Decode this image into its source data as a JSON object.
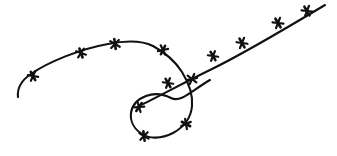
{
  "figure": {
    "background_color": "#ffffff",
    "ink_color": "#111111",
    "canvas": {
      "width": 337,
      "height": 156
    }
  },
  "artwork": {
    "stroke_width": 2.1,
    "wire_segments": [
      {
        "name": "left-sweep-and-hump",
        "path": "M 18 97 C 17 88 22 80 31 74 C 48 62 80 49 108 44 C 128 40 143 41 153 46 C 166 53 175 61 182 72 C 190 85 193 96 192 106 C 191 118 184 127 173 133 C 161 139 149 139 142 134 C 134 129 130 121 131 113 C 132 105 138 99 146 96 C 154 93 163 94 171 98 C 181 103 191 91 210 80"
      },
      {
        "name": "ascending-right-line",
        "path": "M 139 106 C 160 96 185 82 210 70 C 245 53 290 26 325 5"
      }
    ],
    "barbs": [
      {
        "id": "barb-01",
        "x": 33,
        "y": 76,
        "angle": -28,
        "size": 9.5
      },
      {
        "id": "barb-02",
        "x": 81,
        "y": 53,
        "angle": -19,
        "size": 9.5
      },
      {
        "id": "barb-03",
        "x": 115,
        "y": 44,
        "angle": -8,
        "size": 10.0
      },
      {
        "id": "barb-04",
        "x": 163,
        "y": 50,
        "angle": 26,
        "size": 9.5
      },
      {
        "id": "barb-05",
        "x": 192,
        "y": 79,
        "angle": 76,
        "size": 10.0
      },
      {
        "id": "barb-06",
        "x": 186,
        "y": 124,
        "angle": 118,
        "size": 9.5
      },
      {
        "id": "barb-07",
        "x": 144,
        "y": 136,
        "angle": 172,
        "size": 9.5
      },
      {
        "id": "barb-08",
        "x": 139,
        "y": 107,
        "angle": 215,
        "size": 9.5
      },
      {
        "id": "barb-09",
        "x": 168,
        "y": 83,
        "angle": -30,
        "size": 9.5
      },
      {
        "id": "barb-10",
        "x": 213,
        "y": 56,
        "angle": -30,
        "size": 9.5
      },
      {
        "id": "barb-11",
        "x": 242,
        "y": 43,
        "angle": -30,
        "size": 10.0
      },
      {
        "id": "barb-12",
        "x": 278,
        "y": 23,
        "angle": -31,
        "size": 10.0
      },
      {
        "id": "barb-13",
        "x": 307,
        "y": 11,
        "angle": -31,
        "size": 10.0
      }
    ],
    "barb_count": 13,
    "barb_style": {
      "cross_bar_ratio": 1.0,
      "flare_ratio": 0.55,
      "flare_angle": 38,
      "stroke_width": 2.6
    }
  }
}
